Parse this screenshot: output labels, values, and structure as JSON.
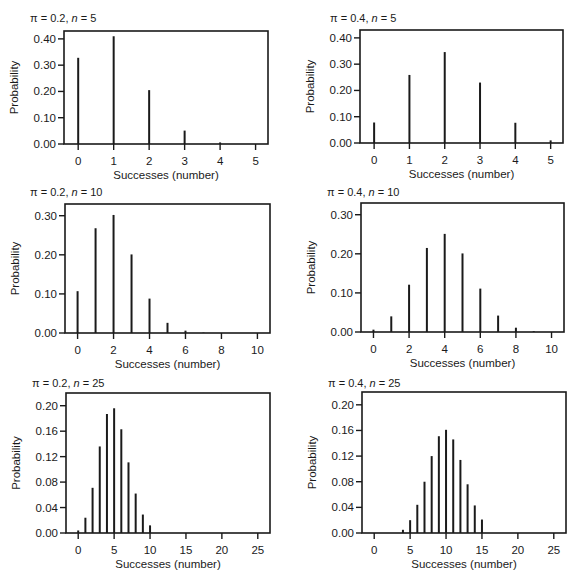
{
  "figure": {
    "panels_layout": "3 rows x 2 columns",
    "xlabel": "Successes (number)",
    "ylabel": "Probability"
  },
  "chart_data": [
    {
      "type": "bar",
      "title": "π = 0.2, n = 5",
      "title_parts": {
        "pi": "π = 0.2, ",
        "n": "n",
        "rest": " = 5"
      },
      "xlabel": "Successes (number)",
      "ylabel": "Probability",
      "x": [
        0,
        1,
        2,
        3,
        4,
        5
      ],
      "values": [
        0.328,
        0.41,
        0.205,
        0.051,
        0.006,
        0.0
      ],
      "xticks": [
        0,
        1,
        2,
        3,
        4,
        5
      ],
      "yticks": [
        "0.00",
        "0.10",
        "0.20",
        "0.30",
        "0.40"
      ],
      "ytick_values": [
        0,
        0.1,
        0.2,
        0.3,
        0.4
      ],
      "xlim": [
        -0.4,
        5.35
      ],
      "ylim": [
        0,
        0.43
      ],
      "grid": false,
      "legend": null
    },
    {
      "type": "bar",
      "title": "π = 0.4, n = 5",
      "title_parts": {
        "pi": "π = 0.4, ",
        "n": "n",
        "rest": " = 5"
      },
      "xlabel": "Successes (number)",
      "ylabel": "Probability",
      "x": [
        0,
        1,
        2,
        3,
        4,
        5
      ],
      "values": [
        0.078,
        0.259,
        0.346,
        0.23,
        0.077,
        0.01
      ],
      "xticks": [
        0,
        1,
        2,
        3,
        4,
        5
      ],
      "yticks": [
        "0.00",
        "0.10",
        "0.20",
        "0.30",
        "0.40"
      ],
      "ytick_values": [
        0,
        0.1,
        0.2,
        0.3,
        0.4
      ],
      "xlim": [
        -0.4,
        5.35
      ],
      "ylim": [
        0,
        0.43
      ],
      "grid": false,
      "legend": null
    },
    {
      "type": "bar",
      "title": "π = 0.2, n = 10",
      "title_parts": {
        "pi": "π = 0.2, ",
        "n": "n",
        "rest": " = 10"
      },
      "xlabel": "Successes (number)",
      "ylabel": "Probability",
      "x": [
        0,
        1,
        2,
        3,
        4,
        5,
        6,
        7,
        8,
        9,
        10
      ],
      "values": [
        0.107,
        0.268,
        0.302,
        0.201,
        0.088,
        0.026,
        0.006,
        0.001,
        0.0,
        0.0,
        0.0
      ],
      "xticks": [
        0,
        2,
        4,
        6,
        8,
        10
      ],
      "yticks": [
        "0.00",
        "0.10",
        "0.20",
        "0.30"
      ],
      "ytick_values": [
        0,
        0.1,
        0.2,
        0.3
      ],
      "xlim": [
        -0.7,
        10.7
      ],
      "ylim": [
        0,
        0.33
      ],
      "grid": false,
      "legend": null
    },
    {
      "type": "bar",
      "title": "π = 0.4, n = 10",
      "title_parts": {
        "pi": "π = 0.4, ",
        "n": "n",
        "rest": " = 10"
      },
      "xlabel": "Successes (number)",
      "ylabel": "Probability",
      "x": [
        0,
        1,
        2,
        3,
        4,
        5,
        6,
        7,
        8,
        9,
        10
      ],
      "values": [
        0.006,
        0.04,
        0.121,
        0.215,
        0.251,
        0.201,
        0.111,
        0.042,
        0.011,
        0.002,
        0.0
      ],
      "xticks": [
        0,
        2,
        4,
        6,
        8,
        10
      ],
      "yticks": [
        "0.00",
        "0.10",
        "0.20",
        "0.30"
      ],
      "ytick_values": [
        0,
        0.1,
        0.2,
        0.3
      ],
      "xlim": [
        -0.7,
        10.7
      ],
      "ylim": [
        0,
        0.33
      ],
      "grid": false,
      "legend": null
    },
    {
      "type": "bar",
      "title": "π = 0.2, n = 25",
      "title_parts": {
        "pi": "π = 0.2, ",
        "n": "n",
        "rest": " = 25"
      },
      "xlabel": "Successes (number)",
      "ylabel": "Probability",
      "x": [
        0,
        1,
        2,
        3,
        4,
        5,
        6,
        7,
        8,
        9,
        10
      ],
      "values": [
        0.004,
        0.024,
        0.071,
        0.136,
        0.187,
        0.196,
        0.163,
        0.111,
        0.062,
        0.029,
        0.012
      ],
      "xticks": [
        0,
        5,
        10,
        15,
        20,
        25
      ],
      "yticks": [
        "0.00",
        "0.04",
        "0.08",
        "0.12",
        "0.16",
        "0.20"
      ],
      "ytick_values": [
        0,
        0.04,
        0.08,
        0.12,
        0.16,
        0.2
      ],
      "xlim": [
        -1.7,
        26.7
      ],
      "ylim": [
        0,
        0.22
      ],
      "grid": false,
      "legend": null
    },
    {
      "type": "bar",
      "title": "π = 0.4, n = 25",
      "title_parts": {
        "pi": "π = 0.4, ",
        "n": "n",
        "rest": " = 25"
      },
      "xlabel": "Successes (number)",
      "ylabel": "Probability",
      "x": [
        4,
        5,
        6,
        7,
        8,
        9,
        10,
        11,
        12,
        13,
        14,
        15
      ],
      "values": [
        0.005,
        0.02,
        0.044,
        0.08,
        0.12,
        0.151,
        0.161,
        0.146,
        0.114,
        0.076,
        0.043,
        0.021
      ],
      "xticks": [
        0,
        5,
        10,
        15,
        20,
        25
      ],
      "yticks": [
        "0.00",
        "0.04",
        "0.08",
        "0.12",
        "0.16",
        "0.20"
      ],
      "ytick_values": [
        0,
        0.04,
        0.08,
        0.12,
        0.16,
        0.2
      ],
      "xlim": [
        -1.7,
        26.7
      ],
      "ylim": [
        0,
        0.22
      ],
      "grid": false,
      "legend": null
    }
  ],
  "layout": {
    "panels": [
      {
        "frame": [
          64,
          31,
          268,
          144
        ],
        "title_xy": [
          30,
          22
        ]
      },
      {
        "frame": [
          360,
          30,
          563,
          143
        ],
        "title_xy": [
          330,
          22
        ]
      },
      {
        "frame": [
          65,
          204,
          270,
          333
        ],
        "title_xy": [
          30,
          196
        ]
      },
      {
        "frame": [
          361,
          203,
          564,
          332
        ],
        "title_xy": [
          327,
          196
        ]
      },
      {
        "frame": [
          66,
          393,
          270,
          533
        ],
        "title_xy": [
          32,
          387
        ]
      },
      {
        "frame": [
          362,
          392,
          566,
          533
        ],
        "title_xy": [
          328,
          387
        ]
      }
    ],
    "colors": {
      "ink": "#1a1a1a",
      "background": "#ffffff"
    }
  }
}
